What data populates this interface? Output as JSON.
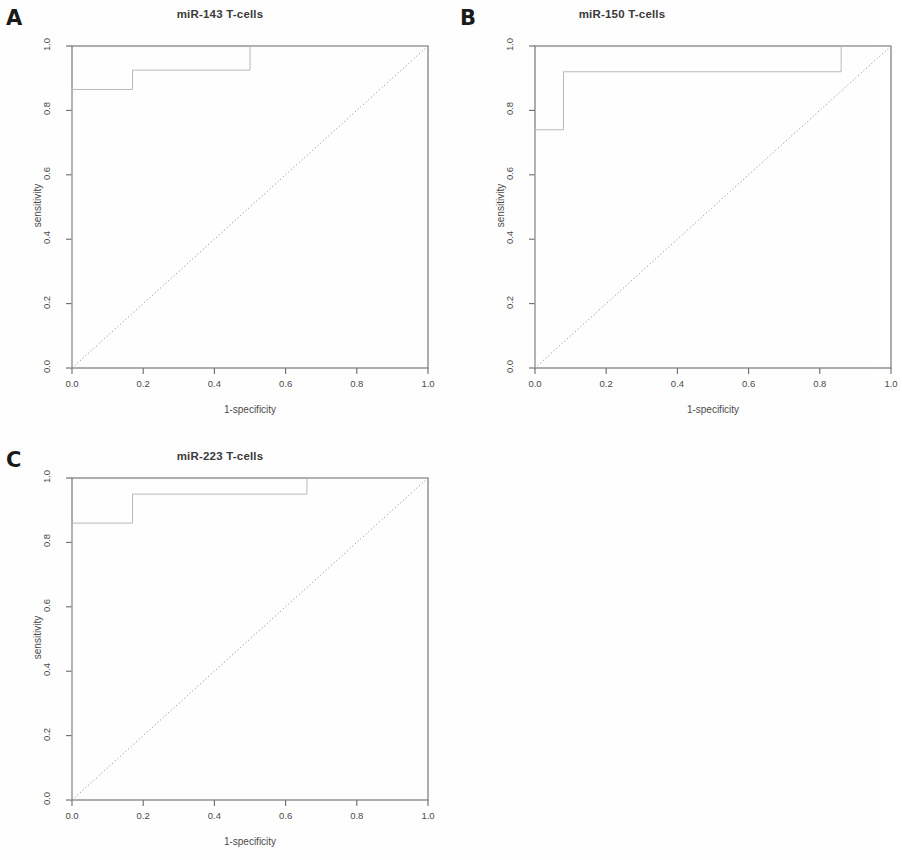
{
  "figure": {
    "background": "#fefefe",
    "panel_letters": [
      "A",
      "B",
      "C"
    ],
    "axis_color": "#6b6b6b",
    "curve_color": "#b9b9b9",
    "diagonal_color": "#8a8a8a"
  },
  "axes": {
    "xlabel": "1-specificity",
    "ylabel": "sensitivity",
    "xticks": [
      "0.0",
      "0.2",
      "0.4",
      "0.6",
      "0.8",
      "1.0"
    ],
    "yticks": [
      "0.0",
      "0.2",
      "0.4",
      "0.6",
      "0.8",
      "1.0"
    ]
  },
  "panels": [
    {
      "letter": "A",
      "title": "miR-143 T-cells",
      "xlabel": "1-specificity",
      "ylabel": "sensitivity"
    },
    {
      "letter": "B",
      "title": "miR-150 T-cells",
      "xlabel": "1-specificity",
      "ylabel": "sensitivity"
    },
    {
      "letter": "C",
      "title": "miR-223 T-cells",
      "xlabel": "1-specificity",
      "ylabel": "sensitivity"
    }
  ],
  "chart_data": [
    {
      "type": "line",
      "panel": "A",
      "title": "miR-143 T-cells",
      "xlabel": "1-specificity",
      "ylabel": "sensitivity",
      "xlim": [
        0.0,
        1.0
      ],
      "ylim": [
        0.0,
        1.0
      ],
      "xticks": [
        0.0,
        0.2,
        0.4,
        0.6,
        0.8,
        1.0
      ],
      "yticks": [
        0.0,
        0.2,
        0.4,
        0.6,
        0.8,
        1.0
      ],
      "grid": false,
      "legend": null,
      "series": [
        {
          "name": "ROC curve",
          "style": "step",
          "x": [
            0.0,
            0.0,
            0.17,
            0.17,
            0.5,
            0.5,
            1.0
          ],
          "y": [
            0.0,
            0.865,
            0.865,
            0.925,
            0.925,
            1.0,
            1.0
          ]
        },
        {
          "name": "reference diagonal",
          "style": "dotted",
          "x": [
            0.0,
            1.0
          ],
          "y": [
            0.0,
            1.0
          ]
        }
      ]
    },
    {
      "type": "line",
      "panel": "B",
      "title": "miR-150 T-cells",
      "xlabel": "1-specificity",
      "ylabel": "sensitivity",
      "xlim": [
        0.0,
        1.0
      ],
      "ylim": [
        0.0,
        1.0
      ],
      "xticks": [
        0.0,
        0.2,
        0.4,
        0.6,
        0.8,
        1.0
      ],
      "yticks": [
        0.0,
        0.2,
        0.4,
        0.6,
        0.8,
        1.0
      ],
      "grid": false,
      "legend": null,
      "series": [
        {
          "name": "ROC curve",
          "style": "step",
          "x": [
            0.0,
            0.0,
            0.08,
            0.08,
            0.86,
            0.86,
            1.0
          ],
          "y": [
            0.0,
            0.74,
            0.74,
            0.92,
            0.92,
            1.0,
            1.0
          ]
        },
        {
          "name": "reference diagonal",
          "style": "dotted",
          "x": [
            0.0,
            1.0
          ],
          "y": [
            0.0,
            1.0
          ]
        }
      ]
    },
    {
      "type": "line",
      "panel": "C",
      "title": "miR-223 T-cells",
      "xlabel": "1-specificity",
      "ylabel": "sensitivity",
      "xlim": [
        0.0,
        1.0
      ],
      "ylim": [
        0.0,
        1.0
      ],
      "xticks": [
        0.0,
        0.2,
        0.4,
        0.6,
        0.8,
        1.0
      ],
      "yticks": [
        0.0,
        0.2,
        0.4,
        0.6,
        0.8,
        1.0
      ],
      "grid": false,
      "legend": null,
      "series": [
        {
          "name": "ROC curve",
          "style": "step",
          "x": [
            0.0,
            0.0,
            0.17,
            0.17,
            0.66,
            0.66,
            1.0
          ],
          "y": [
            0.0,
            0.86,
            0.86,
            0.95,
            0.95,
            1.0,
            1.0
          ]
        },
        {
          "name": "reference diagonal",
          "style": "dotted",
          "x": [
            0.0,
            1.0
          ],
          "y": [
            0.0,
            1.0
          ]
        }
      ]
    }
  ]
}
